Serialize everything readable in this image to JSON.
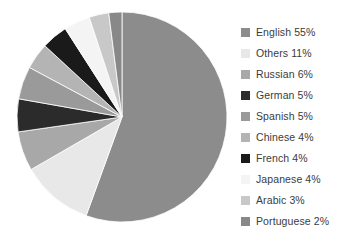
{
  "chart_data": {
    "type": "pie",
    "title": "",
    "subtitle": "",
    "xlabel": "",
    "ylabel": "",
    "legend_position": "right",
    "grid": false,
    "start_angle_deg": 0,
    "direction": "clockwise",
    "categories": [
      "English",
      "Others",
      "Russian",
      "German",
      "Spanish",
      "Chinese",
      "French",
      "Japanese",
      "Arabic",
      "Portuguese"
    ],
    "values": [
      55,
      11,
      6,
      5,
      5,
      4,
      4,
      4,
      3,
      2
    ],
    "unit": "%",
    "colors": [
      "#8c8c8c",
      "#e8e8e8",
      "#a8a8a8",
      "#2b2b2b",
      "#9a9a9a",
      "#b4b4b4",
      "#1a1a1a",
      "#f4f4f4",
      "#c8c8c8",
      "#888888"
    ],
    "slices": [
      {
        "label": "English",
        "value": 55,
        "display": "English 55%",
        "color": "#8c8c8c"
      },
      {
        "label": "Others",
        "value": 11,
        "display": "Others 11%",
        "color": "#e8e8e8"
      },
      {
        "label": "Russian",
        "value": 6,
        "display": "Russian 6%",
        "color": "#a8a8a8"
      },
      {
        "label": "German",
        "value": 5,
        "display": "German 5%",
        "color": "#2b2b2b"
      },
      {
        "label": "Spanish",
        "value": 5,
        "display": "Spanish 5%",
        "color": "#9a9a9a"
      },
      {
        "label": "Chinese",
        "value": 4,
        "display": "Chinese 4%",
        "color": "#b4b4b4"
      },
      {
        "label": "French",
        "value": 4,
        "display": "French 4%",
        "color": "#1a1a1a"
      },
      {
        "label": "Japanese",
        "value": 4,
        "display": "Japanese 4%",
        "color": "#f4f4f4"
      },
      {
        "label": "Arabic",
        "value": 3,
        "display": "Arabic 3%",
        "color": "#c8c8c8"
      },
      {
        "label": "Portuguese",
        "value": 2,
        "display": "Portuguese 2%",
        "color": "#888888"
      }
    ]
  },
  "legend": {
    "items": [
      {
        "label": "English 55%",
        "color": "#8c8c8c"
      },
      {
        "label": "Others 11%",
        "color": "#e8e8e8"
      },
      {
        "label": "Russian 6%",
        "color": "#a8a8a8"
      },
      {
        "label": "German 5%",
        "color": "#2b2b2b"
      },
      {
        "label": "Spanish 5%",
        "color": "#9a9a9a"
      },
      {
        "label": "Chinese 4%",
        "color": "#b4b4b4"
      },
      {
        "label": "French 4%",
        "color": "#1a1a1a"
      },
      {
        "label": "Japanese 4%",
        "color": "#f4f4f4"
      },
      {
        "label": "Arabic 3%",
        "color": "#c8c8c8"
      },
      {
        "label": "Portuguese 2%",
        "color": "#888888"
      }
    ]
  },
  "geometry": {
    "center_x": 122,
    "center_y": 117,
    "radius": 105
  },
  "text_color": "#3b3b3b",
  "background_color": "#ffffff"
}
